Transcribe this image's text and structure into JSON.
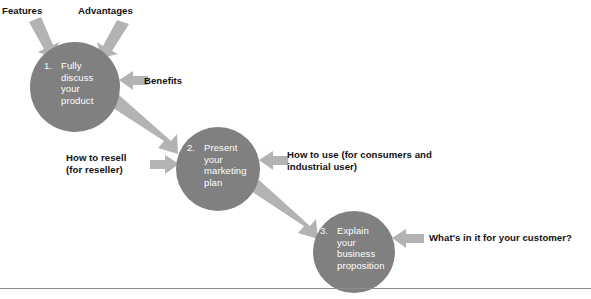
{
  "diagram": {
    "type": "flow-diagram",
    "background_color": "#ffffff",
    "circle_color": "#808080",
    "arrow_color": "#b3b3b3",
    "circle_text_color": "#ffffff",
    "label_text_color": "#111111",
    "rule_color": "#8d8d8d",
    "nodes": [
      {
        "id": "node-1",
        "number": "1.",
        "lines": [
          "Fully",
          "discuss",
          "your",
          "product"
        ],
        "cx": 75,
        "cy": 87,
        "r": 45
      },
      {
        "id": "node-2",
        "number": "2.",
        "lines": [
          "Present",
          "your",
          "marketing",
          "plan"
        ],
        "cx": 218,
        "cy": 169,
        "r": 42
      },
      {
        "id": "node-3",
        "number": "3.",
        "lines": [
          "Explain",
          "your",
          "business",
          "proposition"
        ],
        "cx": 354,
        "cy": 252,
        "r": 41
      }
    ],
    "labels": [
      {
        "id": "label-features",
        "text": "Features",
        "target": "node-1",
        "position": "top-left"
      },
      {
        "id": "label-advantages",
        "text": "Advantages",
        "target": "node-1",
        "position": "top-right"
      },
      {
        "id": "label-benefits",
        "text": "Benefits",
        "target": "node-1",
        "position": "right"
      },
      {
        "id": "label-how-to-resell",
        "text": "How to resell\n(for reseller)",
        "target": "node-2",
        "position": "left"
      },
      {
        "id": "label-how-to-use",
        "text": "How to use (for consumers and\nindustrial user)",
        "target": "node-2",
        "position": "right"
      },
      {
        "id": "label-whats-in-it",
        "text": "What's in it for your customer?",
        "target": "node-3",
        "position": "right"
      }
    ],
    "connectors": [
      {
        "id": "connector-1-to-2",
        "from": "node-1",
        "to": "node-2"
      },
      {
        "id": "connector-2-to-3",
        "from": "node-2",
        "to": "node-3"
      }
    ]
  }
}
